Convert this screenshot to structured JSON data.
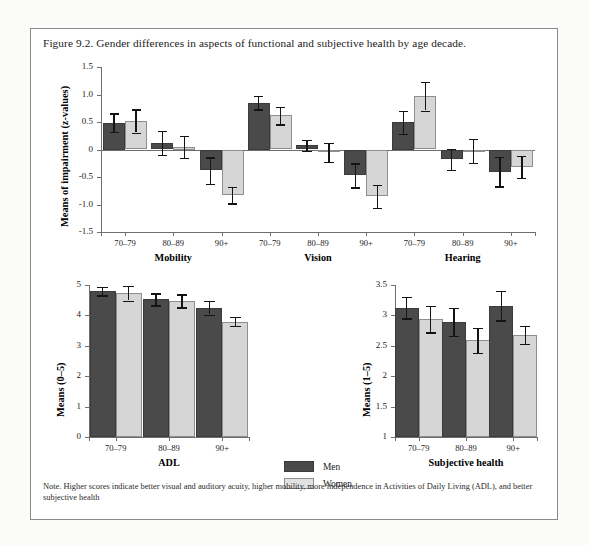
{
  "figure": {
    "caption": "Figure 9.2. Gender differences in aspects of functional and subjective health by age decade.",
    "note": "Note. Higher scores indicate better visual and auditory acuity, higher mobility, more independence in Activities of Daily Living (ADL), and better subjective health"
  },
  "legend": {
    "men_label": "Men",
    "women_label": "Women",
    "men_color": "#4a4a4a",
    "women_color": "#d6d6d6"
  },
  "chart_data": [
    {
      "type": "bar",
      "id": "impairment",
      "title": "",
      "xlabel": "",
      "ylabel": "Means of impairment (z-values)",
      "ylim": [
        -1.5,
        1.5
      ],
      "yticks": [
        1.5,
        1.0,
        0.5,
        0.0,
        -0.5,
        -1.0,
        -1.5
      ],
      "ytick_labels": [
        "1.5",
        "1.0",
        "0.5",
        "0",
        "-0.5",
        "-1.0",
        "-1.5"
      ],
      "grid": false,
      "legend_position": "bottom-center",
      "groups": [
        "Mobility",
        "Vision",
        "Hearing"
      ],
      "categories": [
        "70–79",
        "80–89",
        "90+"
      ],
      "series": [
        {
          "name": "Men",
          "values": [
            0.49,
            0.12,
            -0.38,
            0.85,
            0.08,
            -0.47,
            0.5,
            -0.18,
            -0.4
          ],
          "errors": [
            0.17,
            0.22,
            0.24,
            0.12,
            0.1,
            0.22,
            0.21,
            0.19,
            0.27
          ]
        },
        {
          "name": "Women",
          "values": [
            0.52,
            0.05,
            -0.83,
            0.62,
            -0.05,
            -0.85,
            0.97,
            -0.02,
            -0.32
          ],
          "errors": [
            0.21,
            0.2,
            0.15,
            0.16,
            0.17,
            0.21,
            0.26,
            0.22,
            0.2
          ]
        }
      ]
    },
    {
      "type": "bar",
      "id": "adl",
      "title": "",
      "xlabel": "ADL",
      "ylabel": "Means (0–5)",
      "ylim": [
        0,
        5
      ],
      "yticks": [
        5,
        4,
        3,
        2,
        1,
        0
      ],
      "ytick_labels": [
        "5",
        "4",
        "3",
        "2",
        "1",
        "0"
      ],
      "grid": false,
      "categories": [
        "70–79",
        "80–89",
        "90+"
      ],
      "series": [
        {
          "name": "Men",
          "values": [
            4.8,
            4.53,
            4.25
          ],
          "errors": [
            0.14,
            0.2,
            0.22
          ]
        },
        {
          "name": "Women",
          "values": [
            4.73,
            4.48,
            3.8
          ],
          "errors": [
            0.24,
            0.21,
            0.15
          ]
        }
      ]
    },
    {
      "type": "bar",
      "id": "subjective-health",
      "title": "",
      "xlabel": "Subjective health",
      "ylabel": "Means (1–5)",
      "ylim": [
        1,
        3.5
      ],
      "yticks": [
        3.5,
        3,
        2.5,
        2,
        1.5,
        1
      ],
      "ytick_labels": [
        "3.5",
        "3",
        "2.5",
        "2",
        "1.5",
        "1"
      ],
      "grid": false,
      "categories": [
        "70–79",
        "80–89",
        "90+"
      ],
      "series": [
        {
          "name": "Men",
          "values": [
            3.13,
            2.9,
            3.16
          ],
          "errors": [
            0.18,
            0.23,
            0.24
          ]
        },
        {
          "name": "Women",
          "values": [
            2.94,
            2.59,
            2.68
          ],
          "errors": [
            0.22,
            0.21,
            0.15
          ]
        }
      ]
    }
  ]
}
